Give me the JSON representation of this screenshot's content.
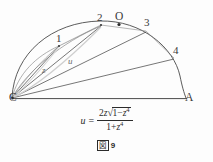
{
  "figure": {
    "caption_fig_char": "図",
    "caption_number": "9",
    "stroke_color": "#4a4a4a",
    "faint_stroke_color": "#b9b9b9",
    "text_color": "#2b2b2b"
  },
  "points": [
    {
      "id": "C",
      "label": "C",
      "x": 12,
      "y": 98
    },
    {
      "id": "A",
      "label": "A",
      "x": 186,
      "y": 98
    },
    {
      "id": "O",
      "label": "O",
      "x": 119,
      "y": 23
    },
    {
      "id": "P1",
      "label": "1",
      "x": 58,
      "y": 42
    },
    {
      "id": "P2",
      "label": "2",
      "x": 99,
      "y": 21
    },
    {
      "id": "P3",
      "label": "3",
      "x": 146,
      "y": 26
    },
    {
      "id": "P4",
      "label": "4",
      "x": 174,
      "y": 54
    }
  ],
  "annotations": [
    {
      "id": "z",
      "label": "z",
      "x": 44,
      "y": 70
    },
    {
      "id": "u",
      "label": "u",
      "x": 70,
      "y": 61
    }
  ],
  "formula": {
    "lhs": "u",
    "equals": "=",
    "numerator": "2z √(1 − z⁴)",
    "denominator": "1 + z⁴",
    "num_coeff": "2",
    "num_var": "z",
    "radical_sign": "√",
    "radicand_left": "1",
    "radicand_minus": "−",
    "radicand_var": "z",
    "radicand_exp": "4",
    "den_one": "1",
    "den_plus": "+",
    "den_var": "z",
    "den_exp": "4"
  },
  "geometry": {
    "arc_center_x": 119,
    "arc_center_y": 98,
    "arc_radius_x": 67,
    "arc_radius_y": 75,
    "baseline_from": [
      12,
      98
    ],
    "baseline_to": [
      186,
      98
    ]
  }
}
